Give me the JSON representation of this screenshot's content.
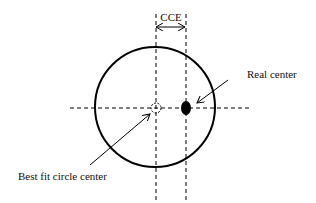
{
  "diagram": {
    "title_label": "CCE",
    "labels": {
      "real_center": "Real center",
      "best_fit_center": "Best fit circle center"
    },
    "colors": {
      "stroke": "#000000",
      "background": "#ffffff",
      "text": "#111111"
    },
    "geometry": {
      "circle": {
        "cx": 155,
        "cy": 107,
        "r": 60
      },
      "best_fit_center": {
        "x": 156,
        "y": 108,
        "r": 5
      },
      "real_center": {
        "x": 186,
        "y": 108,
        "rx": 5,
        "ry": 7
      }
    }
  }
}
